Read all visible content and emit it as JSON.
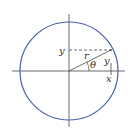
{
  "diagram": {
    "labels": {
      "y_axis_point": "y",
      "radius": "r",
      "angle": "θ",
      "vertical_leg": "y",
      "horizontal_point": "x"
    },
    "colors": {
      "circle": "#4a5fae",
      "axes": "#444444",
      "lines": "#444444"
    }
  }
}
